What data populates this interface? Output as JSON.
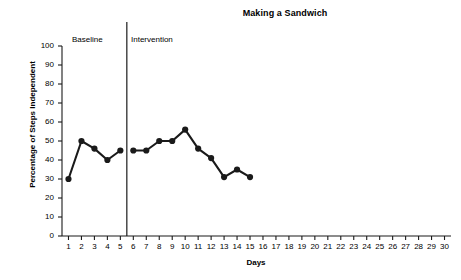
{
  "chart_data": {
    "type": "line",
    "title": "Making a Sandwich",
    "xlabel": "Days",
    "ylabel": "Percentage of Steps Independent",
    "xlim": [
      0.5,
      30.5
    ],
    "ylim": [
      0,
      100
    ],
    "xticks": [
      1,
      2,
      3,
      4,
      5,
      6,
      7,
      8,
      9,
      10,
      11,
      12,
      13,
      14,
      15,
      16,
      17,
      18,
      19,
      20,
      21,
      22,
      23,
      24,
      25,
      26,
      27,
      28,
      29,
      30
    ],
    "yticks": [
      0,
      10,
      20,
      30,
      40,
      50,
      60,
      70,
      80,
      90,
      100
    ],
    "grid": false,
    "legend": null,
    "marker": "filled-circle",
    "line_color": "#1a1a1a",
    "series": [
      {
        "name": "Baseline",
        "x": [
          1,
          2,
          3,
          4,
          5
        ],
        "values": [
          30,
          50,
          46,
          40,
          45
        ]
      },
      {
        "name": "Intervention",
        "x": [
          6,
          7,
          8,
          9,
          10,
          11,
          12,
          13,
          14,
          15
        ],
        "values": [
          45,
          45,
          50,
          50,
          56,
          46,
          41,
          31,
          35,
          31
        ]
      }
    ],
    "phases": [
      {
        "label": "Baseline",
        "start": 1,
        "end": 5
      },
      {
        "label": "Intervention",
        "start": 6,
        "end": 30
      }
    ],
    "phase_divider_x": 5.5,
    "annotations": []
  }
}
